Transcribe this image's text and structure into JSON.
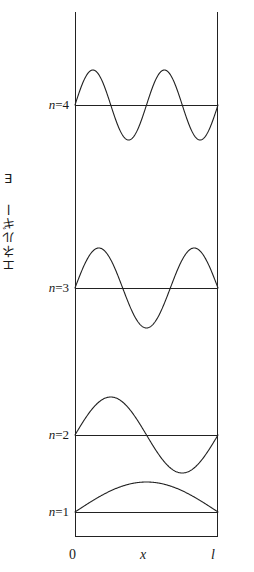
{
  "figure": {
    "title": "",
    "y_axis_label": "エネルギー E",
    "x_axis_ticks": [
      {
        "label": "0",
        "italic": false,
        "x_px": 74
      },
      {
        "label": "x",
        "italic": true,
        "x_px": 145
      },
      {
        "label": "l",
        "italic": true,
        "x_px": 216
      }
    ],
    "levels": [
      {
        "n": 4,
        "label": "n=4",
        "y_px": 105
      },
      {
        "n": 3,
        "label": "n=3",
        "y_px": 288
      },
      {
        "n": 2,
        "label": "n=2",
        "y_px": 435
      },
      {
        "n": 1,
        "label": "n=1",
        "y_px": 512
      }
    ],
    "box": {
      "left_px": 75,
      "right_px": 218,
      "top_px": 12,
      "bottom_px": 537
    },
    "stroke_color": "#222222",
    "background_color": "#ffffff"
  },
  "chart_data": {
    "type": "line",
    "title": "",
    "subtitle": "",
    "xlabel": "x",
    "ylabel": "エネルギー E",
    "xlim": [
      0,
      1
    ],
    "ylim": [
      0,
      4
    ],
    "grid": false,
    "legend_position": "none",
    "x_tick_labels": [
      "0",
      "x",
      "l"
    ],
    "x_tick_values": [
      0,
      0.5,
      1
    ],
    "y_tick_labels": [
      "n=1",
      "n=2",
      "n=3",
      "n=4"
    ],
    "series": [
      {
        "name": "n=1",
        "quantum_number": 1,
        "half_wavelengths": 1,
        "baseline_y_px": 512,
        "amplitude_px": 30,
        "nodes": 0,
        "formula": "sin(1*pi*x/l)"
      },
      {
        "name": "n=2",
        "quantum_number": 2,
        "half_wavelengths": 2,
        "baseline_y_px": 435,
        "amplitude_px": 38,
        "nodes": 1,
        "formula": "sin(2*pi*x/l)"
      },
      {
        "name": "n=3",
        "quantum_number": 3,
        "half_wavelengths": 3,
        "baseline_y_px": 288,
        "amplitude_px": 40,
        "nodes": 2,
        "formula": "sin(3*pi*x/l)"
      },
      {
        "name": "n=4",
        "quantum_number": 4,
        "half_wavelengths": 4,
        "baseline_y_px": 105,
        "amplitude_px": 35,
        "nodes": 3,
        "formula": "sin(4*pi*x/l)"
      }
    ]
  }
}
